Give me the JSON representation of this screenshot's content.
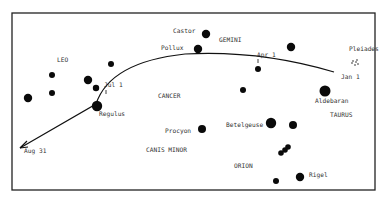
{
  "diagram": {
    "frame": {
      "x": 12,
      "y": 13,
      "w": 363,
      "h": 177,
      "color": "#222222"
    },
    "curve": {
      "points": "M 334 72 Q 260 50 185 54 Q 110 62 96 104 L 20 148",
      "color": "#111111"
    },
    "date_markers": [
      {
        "label": "Jan 1",
        "x": 341,
        "y": 79
      },
      {
        "label": "Apr 1",
        "x": 257,
        "y": 57
      },
      {
        "label": "Jul 1",
        "x": 104,
        "y": 87
      },
      {
        "label": "Aug 31",
        "x": 24,
        "y": 153
      }
    ],
    "constellations": [
      {
        "label": "LEO",
        "x": 57,
        "y": 62
      },
      {
        "label": "GEMINI",
        "x": 219,
        "y": 42
      },
      {
        "label": "CANCER",
        "x": 158,
        "y": 98
      },
      {
        "label": "TAURUS",
        "x": 330,
        "y": 117
      },
      {
        "label": "CANIS MINOR",
        "x": 146,
        "y": 152
      },
      {
        "label": "ORION",
        "x": 234,
        "y": 168
      }
    ],
    "stars": [
      {
        "name": "Castor",
        "x": 206,
        "y": 34,
        "r": 4.2,
        "label_x": 173,
        "label_y": 33
      },
      {
        "name": "Pollux",
        "x": 198,
        "y": 49,
        "r": 4.2,
        "label_x": 161,
        "label_y": 50
      },
      {
        "name": "Pleiades",
        "x": 355,
        "y": 63,
        "r": 0,
        "label_x": 349,
        "label_y": 51
      },
      {
        "name": "Aldebaran",
        "x": 325,
        "y": 91,
        "r": 5.5,
        "label_x": 315,
        "label_y": 103
      },
      {
        "name": "Regulus",
        "x": 97,
        "y": 106,
        "r": 5.2,
        "label_x": 99,
        "label_y": 116
      },
      {
        "name": "Procyon",
        "x": 202,
        "y": 129,
        "r": 4.0,
        "label_x": 165,
        "label_y": 133
      },
      {
        "name": "Betelgeuse",
        "x": 271,
        "y": 123,
        "r": 5.2,
        "label_x": 226,
        "label_y": 127
      },
      {
        "name": "Rigel",
        "x": 300,
        "y": 177,
        "r": 4.2,
        "label_x": 309,
        "label_y": 177
      },
      {
        "name": "",
        "x": 52,
        "y": 75,
        "r": 3.0
      },
      {
        "name": "",
        "x": 111,
        "y": 64,
        "r": 3.0
      },
      {
        "name": "",
        "x": 88,
        "y": 80,
        "r": 4.2
      },
      {
        "name": "",
        "x": 96,
        "y": 88,
        "r": 3.2
      },
      {
        "name": "",
        "x": 52,
        "y": 93,
        "r": 3.0
      },
      {
        "name": "",
        "x": 28,
        "y": 98,
        "r": 4.2
      },
      {
        "name": "",
        "x": 291,
        "y": 47,
        "r": 4.2
      },
      {
        "name": "",
        "x": 258,
        "y": 69,
        "r": 3.0
      },
      {
        "name": "",
        "x": 243,
        "y": 90,
        "r": 3.0
      },
      {
        "name": "",
        "x": 293,
        "y": 125,
        "r": 4.0
      },
      {
        "name": "",
        "x": 281,
        "y": 153,
        "r": 2.8
      },
      {
        "name": "",
        "x": 285,
        "y": 150,
        "r": 2.8
      },
      {
        "name": "",
        "x": 288,
        "y": 147,
        "r": 2.8
      },
      {
        "name": "",
        "x": 276,
        "y": 181,
        "r": 3.0
      }
    ],
    "pleiades_cluster": [
      {
        "x": 353,
        "y": 61
      },
      {
        "x": 356,
        "y": 62
      },
      {
        "x": 358,
        "y": 64
      },
      {
        "x": 355,
        "y": 65
      },
      {
        "x": 352,
        "y": 63
      },
      {
        "x": 357,
        "y": 60
      }
    ]
  }
}
